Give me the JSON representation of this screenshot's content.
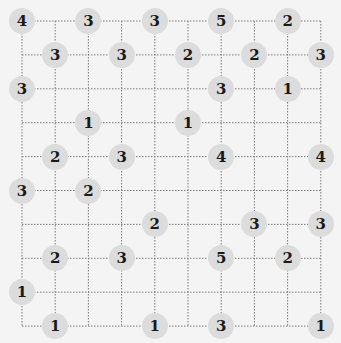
{
  "game": "Hashi (Bridges)",
  "grid": {
    "cols": 10,
    "rows": 10,
    "origin_x": 22,
    "origin_y": 21,
    "step_x": 33.2,
    "step_y": 33.9,
    "line_color": "#7a7a7a",
    "node_fill": "#dcdcdc"
  },
  "islands": [
    {
      "col": 0,
      "row": 0,
      "value": "4"
    },
    {
      "col": 2,
      "row": 0,
      "value": "3"
    },
    {
      "col": 4,
      "row": 0,
      "value": "3"
    },
    {
      "col": 6,
      "row": 0,
      "value": "5"
    },
    {
      "col": 8,
      "row": 0,
      "value": "2"
    },
    {
      "col": 1,
      "row": 1,
      "value": "3"
    },
    {
      "col": 3,
      "row": 1,
      "value": "3"
    },
    {
      "col": 5,
      "row": 1,
      "value": "2"
    },
    {
      "col": 7,
      "row": 1,
      "value": "2"
    },
    {
      "col": 9,
      "row": 1,
      "value": "3"
    },
    {
      "col": 0,
      "row": 2,
      "value": "3"
    },
    {
      "col": 6,
      "row": 2,
      "value": "3"
    },
    {
      "col": 8,
      "row": 2,
      "value": "1"
    },
    {
      "col": 2,
      "row": 3,
      "value": "1"
    },
    {
      "col": 5,
      "row": 3,
      "value": "1"
    },
    {
      "col": 1,
      "row": 4,
      "value": "2"
    },
    {
      "col": 3,
      "row": 4,
      "value": "3"
    },
    {
      "col": 6,
      "row": 4,
      "value": "4"
    },
    {
      "col": 9,
      "row": 4,
      "value": "4"
    },
    {
      "col": 0,
      "row": 5,
      "value": "3"
    },
    {
      "col": 2,
      "row": 5,
      "value": "2"
    },
    {
      "col": 4,
      "row": 6,
      "value": "2"
    },
    {
      "col": 7,
      "row": 6,
      "value": "3"
    },
    {
      "col": 9,
      "row": 6,
      "value": "3"
    },
    {
      "col": 1,
      "row": 7,
      "value": "2"
    },
    {
      "col": 3,
      "row": 7,
      "value": "3"
    },
    {
      "col": 6,
      "row": 7,
      "value": "5"
    },
    {
      "col": 8,
      "row": 7,
      "value": "2"
    },
    {
      "col": 0,
      "row": 8,
      "value": "1"
    },
    {
      "col": 1,
      "row": 9,
      "value": "1"
    },
    {
      "col": 4,
      "row": 9,
      "value": "1"
    },
    {
      "col": 6,
      "row": 9,
      "value": "3"
    },
    {
      "col": 9,
      "row": 9,
      "value": "1"
    }
  ]
}
